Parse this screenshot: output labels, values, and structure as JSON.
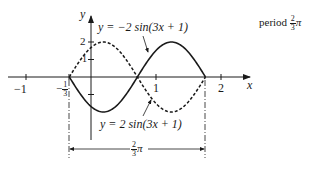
{
  "figure": {
    "axis_x_label": "x",
    "axis_y_label": "y",
    "x_ticks": [
      {
        "value": -1,
        "label": "−1"
      },
      {
        "value": -0.3333,
        "label_num": "1",
        "label_den": "3",
        "label_sign": "−"
      },
      {
        "value": 1,
        "label": "1"
      },
      {
        "value": 2,
        "label": "2"
      }
    ],
    "y_ticks": [
      {
        "value": 1,
        "label": "1"
      },
      {
        "value": 2,
        "label": "2"
      },
      {
        "value": -1,
        "label": ""
      }
    ],
    "curves": [
      {
        "name": "solid",
        "equation": "y = −2 sin(3x + 1)",
        "style": "solid",
        "amplitude": -2,
        "b": 3,
        "c": 1
      },
      {
        "name": "dashed",
        "equation": "y = 2 sin(3x + 1)",
        "style": "dashed",
        "amplitude": 2,
        "b": 3,
        "c": 1
      }
    ],
    "label_top": "y = −2 sin(3x + 1)",
    "label_bottom": "y = 2 sin(3x + 1)",
    "period_text": "period",
    "period_num": "2",
    "period_den": "3",
    "pi": "π",
    "dimension_num": "2",
    "dimension_den": "3",
    "interval_start": "−1/3",
    "interval_end": "(2π − 1)/3"
  }
}
